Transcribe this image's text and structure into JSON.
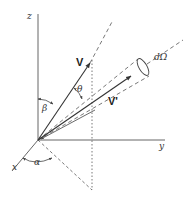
{
  "diagram": {
    "type": "3d-vector-geometry",
    "axes": {
      "x": {
        "label": "x"
      },
      "y": {
        "label": "y"
      },
      "z": {
        "label": "z"
      }
    },
    "vectors": {
      "v": {
        "label": "V"
      },
      "v_prime": {
        "label": "V'"
      }
    },
    "angles": {
      "alpha": {
        "label": "α"
      },
      "beta": {
        "label": "β"
      },
      "theta": {
        "label": "θ"
      }
    },
    "solid_angle": {
      "label": "dΩ"
    },
    "colors": {
      "line": "#444444",
      "text": "#333333",
      "background": "#ffffff"
    }
  }
}
